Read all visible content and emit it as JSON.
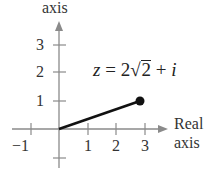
{
  "diagram": {
    "type": "complex-plane",
    "y_axis_label": "axis",
    "x_axis_label_line1": "Real",
    "x_axis_label_line2": "axis",
    "x_ticks": [
      "−1",
      "1",
      "2",
      "3"
    ],
    "y_ticks": [
      "1",
      "2",
      "3"
    ],
    "equation": {
      "lhs": "z",
      "equals": "=",
      "coef": "2",
      "radical": "√",
      "radicand": "2",
      "plus": "+",
      "imag": "i"
    },
    "point": {
      "x": 2.83,
      "y": 1
    },
    "colors": {
      "axis": "#888888",
      "vector": "#111111",
      "text": "#333333"
    }
  }
}
